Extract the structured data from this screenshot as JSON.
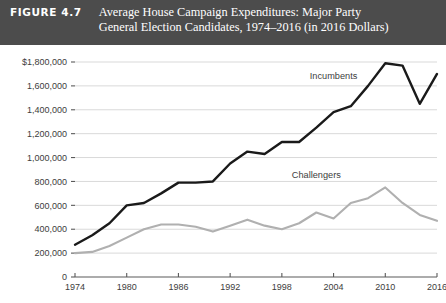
{
  "header": {
    "figure_number": "FIGURE 4.7",
    "title_line_1": "Average House Campaign Expenditures: Major Party",
    "title_line_2": "General Election Candidates, 1974–2016 (in 2016 Dollars)"
  },
  "colors": {
    "header_background": "#4c4c4c",
    "header_text": "#ffffff",
    "incumbents_line": "#1a1a1a",
    "challengers_line": "#b0b0b0",
    "gridline": "#d9d9d9",
    "axis": "#5a5a5a",
    "plot_background": "#ffffff"
  },
  "chart_data": {
    "type": "line",
    "title": "Average House Campaign Expenditures: Major Party General Election Candidates, 1974–2016 (in 2016 Dollars)",
    "xlabel": "",
    "ylabel": "",
    "x": [
      1974,
      1976,
      1978,
      1980,
      1982,
      1984,
      1986,
      1988,
      1990,
      1992,
      1994,
      1996,
      1998,
      2000,
      2002,
      2004,
      2006,
      2008,
      2010,
      2012,
      2014,
      2016
    ],
    "xlim": [
      1974,
      2016
    ],
    "ylim": [
      0,
      1800000
    ],
    "ytick_values": [
      0,
      200000,
      400000,
      600000,
      800000,
      1000000,
      1200000,
      1400000,
      1600000,
      1800000
    ],
    "ytick_labels": [
      "0",
      "200,000",
      "400,000",
      "600,000",
      "800,000",
      "1,000,000",
      "1,200,000",
      "1,400,000",
      "1,600,000",
      "$1,800,000"
    ],
    "xtick_values": [
      1974,
      1980,
      1986,
      1992,
      1998,
      2004,
      2010,
      2016
    ],
    "xtick_labels": [
      "1974",
      "1980",
      "1986",
      "1992",
      "1998",
      "2004",
      "2010",
      "2016"
    ],
    "grid": "horizontal",
    "legend": "inline-annotations",
    "series": [
      {
        "name": "Incumbents",
        "color": "#1a1a1a",
        "label_x": 2004,
        "label_y": 1660000,
        "values": [
          270000,
          350000,
          450000,
          600000,
          620000,
          700000,
          790000,
          790000,
          800000,
          950000,
          1050000,
          1030000,
          1130000,
          1130000,
          1250000,
          1380000,
          1430000,
          1600000,
          1790000,
          1770000,
          1450000,
          1700000
        ]
      },
      {
        "name": "Challengers",
        "color": "#b0b0b0",
        "label_x": 2002,
        "label_y": 830000,
        "values": [
          200000,
          210000,
          260000,
          330000,
          400000,
          440000,
          440000,
          420000,
          380000,
          430000,
          480000,
          430000,
          400000,
          450000,
          540000,
          490000,
          620000,
          660000,
          750000,
          620000,
          520000,
          470000
        ]
      }
    ]
  },
  "axis_titles": {
    "y_axis_name": "expenditures-dollars",
    "x_axis_name": "election-year"
  }
}
